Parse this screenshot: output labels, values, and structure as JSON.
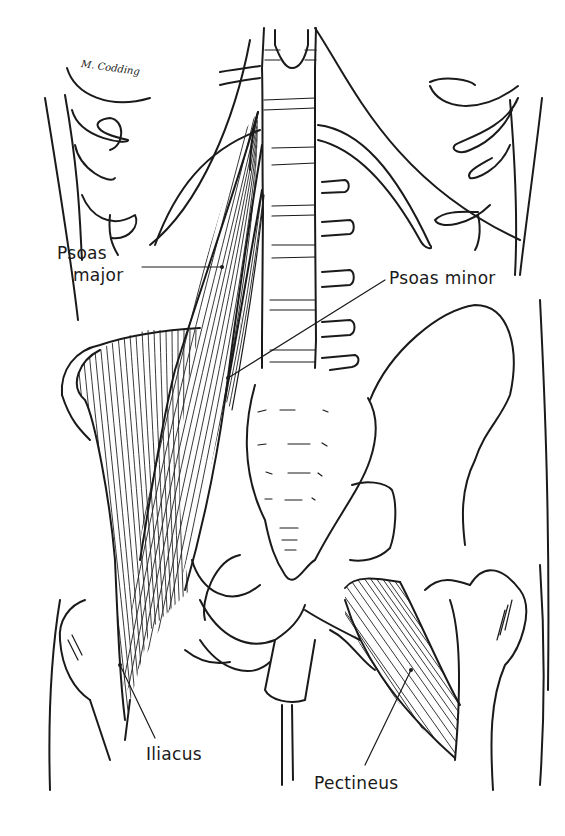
{
  "figure": {
    "signature": "M. Codding",
    "labels": {
      "psoas_major_line1": "Psoas",
      "psoas_major_line2": "major",
      "psoas_minor": "Psoas minor",
      "iliacus": "Iliacus",
      "pectineus": "Pectineus"
    },
    "colors": {
      "ink": "#1a1a1a",
      "background": "#ffffff"
    }
  }
}
